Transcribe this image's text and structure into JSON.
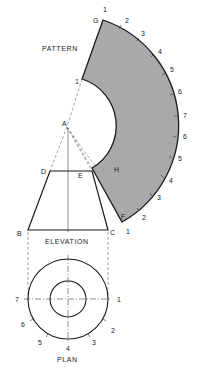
{
  "figure": {
    "type": "sheet-metal development drawing",
    "colors": {
      "line": "#1a1a1a",
      "pattern_fill": "#a9a9a9",
      "background": "#ffffff",
      "dashed": "#555555"
    }
  },
  "labels": {
    "pattern": "PATTERN",
    "elevation": "ELEVATION",
    "plan": "PLAN"
  },
  "points": {
    "apex": "A",
    "elevation_bottom_left": "B",
    "elevation_bottom_right": "C",
    "elevation_top_left": "D",
    "elevation_top_right": "E",
    "pattern_outer_start": "G",
    "pattern_outer_end": "F",
    "pattern_inner_end": "H"
  },
  "pattern_divisions": {
    "outer_arc": [
      "1",
      "2",
      "3",
      "4",
      "5",
      "6",
      "7",
      "6",
      "5",
      "4",
      "3",
      "2",
      "1"
    ],
    "inner_start": "1"
  },
  "plan_divisions": [
    "1",
    "2",
    "3",
    "4",
    "5",
    "6",
    "7"
  ]
}
